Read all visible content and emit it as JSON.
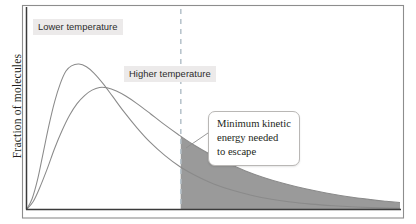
{
  "chart_data": {
    "type": "line",
    "title": "",
    "subtitle": "",
    "xlabel": "",
    "ylabel": "Fraction of molecules",
    "grid": false,
    "legend_position": "inline-labels",
    "axis": {
      "x_range_note": "kinetic energy (unlabeled axis, no ticks)",
      "y_range_note": "fraction of molecules (unlabeled axis, no ticks)",
      "x_ticks": [],
      "y_ticks": []
    },
    "series": [
      {
        "name": "Lower temperature",
        "label": "Lower temperature",
        "color": "#8a8a8a",
        "peak_x_rel": 0.14,
        "peak_y_rel": 0.81,
        "points_rel": [
          [
            0.0,
            0.0
          ],
          [
            0.015,
            0.06
          ],
          [
            0.03,
            0.17
          ],
          [
            0.045,
            0.32
          ],
          [
            0.06,
            0.47
          ],
          [
            0.075,
            0.6
          ],
          [
            0.09,
            0.7
          ],
          [
            0.105,
            0.77
          ],
          [
            0.12,
            0.8
          ],
          [
            0.14,
            0.81
          ],
          [
            0.16,
            0.795
          ],
          [
            0.18,
            0.76
          ],
          [
            0.205,
            0.7
          ],
          [
            0.23,
            0.63
          ],
          [
            0.26,
            0.545
          ],
          [
            0.295,
            0.455
          ],
          [
            0.33,
            0.375
          ],
          [
            0.37,
            0.3
          ],
          [
            0.41,
            0.238
          ],
          [
            0.455,
            0.185
          ],
          [
            0.5,
            0.142
          ],
          [
            0.55,
            0.107
          ],
          [
            0.6,
            0.08
          ],
          [
            0.65,
            0.059
          ],
          [
            0.7,
            0.043
          ],
          [
            0.76,
            0.03
          ],
          [
            0.82,
            0.021
          ],
          [
            0.88,
            0.014
          ],
          [
            0.94,
            0.009
          ],
          [
            1.0,
            0.006
          ]
        ]
      },
      {
        "name": "Higher temperature",
        "label": "Higher temperature",
        "color": "#8a8a8a",
        "peak_x_rel": 0.195,
        "peak_y_rel": 0.68,
        "points_rel": [
          [
            0.0,
            0.0
          ],
          [
            0.018,
            0.045
          ],
          [
            0.035,
            0.12
          ],
          [
            0.055,
            0.225
          ],
          [
            0.075,
            0.34
          ],
          [
            0.095,
            0.44
          ],
          [
            0.115,
            0.525
          ],
          [
            0.135,
            0.59
          ],
          [
            0.155,
            0.635
          ],
          [
            0.175,
            0.665
          ],
          [
            0.195,
            0.68
          ],
          [
            0.215,
            0.678
          ],
          [
            0.24,
            0.66
          ],
          [
            0.265,
            0.632
          ],
          [
            0.295,
            0.59
          ],
          [
            0.33,
            0.535
          ],
          [
            0.365,
            0.478
          ],
          [
            0.405,
            0.418
          ],
          [
            0.445,
            0.362
          ],
          [
            0.49,
            0.308
          ],
          [
            0.535,
            0.26
          ],
          [
            0.585,
            0.215
          ],
          [
            0.635,
            0.177
          ],
          [
            0.69,
            0.143
          ],
          [
            0.745,
            0.115
          ],
          [
            0.8,
            0.092
          ],
          [
            0.86,
            0.071
          ],
          [
            0.92,
            0.055
          ],
          [
            0.96,
            0.046
          ],
          [
            1.0,
            0.038
          ]
        ]
      }
    ],
    "threshold": {
      "label": "Minimum kinetic energy needed to escape",
      "x_rel": 0.412,
      "style": "dashed",
      "color": "#b8c4cc"
    },
    "shaded_regions": [
      {
        "name": "escaping-molecules-higher-temperature",
        "from_x_rel": 0.412,
        "to_x_rel": 1.0,
        "under_series": "Higher temperature",
        "color": "#9a9a9a"
      },
      {
        "name": "escaping-molecules-lower-temperature",
        "from_x_rel": 0.412,
        "to_x_rel": 1.0,
        "under_series": "Lower temperature",
        "color": "#bdbdbd"
      }
    ]
  },
  "labels": {
    "y_axis": "Fraction of molecules",
    "lower_temperature": "Lower temperature",
    "higher_temperature": "Higher temperature"
  },
  "callout": {
    "line1": "Minimum kinetic",
    "line2": "energy needed",
    "line3": "to escape"
  },
  "colors": {
    "frame": "#8d8d8d",
    "axis": "#3b3b3b",
    "curve": "#8a8a8a",
    "dashed_line": "#b8c4cc",
    "shade_dark": "#9a9a9a",
    "shade_light": "#bdbdbd",
    "label_background": "#eceaea",
    "text": "#231f20"
  }
}
